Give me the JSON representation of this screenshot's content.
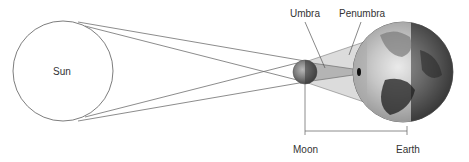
{
  "diagram": {
    "type": "solar-eclipse",
    "labels": {
      "sun": "Sun",
      "umbra": "Umbra",
      "penumbra": "Penumbra",
      "moon": "Moon",
      "earth": "Earth"
    },
    "colors": {
      "line": "#6e6e6e",
      "penumbra_fill": "#dcdcdc",
      "umbra_fill": "#b4b4b4",
      "text": "#333333"
    }
  }
}
